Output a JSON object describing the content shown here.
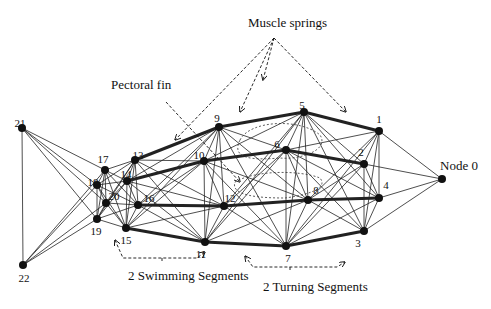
{
  "diagram": {
    "colors": {
      "ink": "#111111",
      "thin_edge": "#222222",
      "background": "#ffffff"
    },
    "nodes": [
      {
        "id": "0",
        "label": "Node 0",
        "x": 442,
        "y": 179,
        "lx": 440,
        "ly": 170,
        "anchor": "start",
        "ldx": -2
      },
      {
        "id": "1",
        "label": "1",
        "x": 379,
        "y": 131,
        "lx": 379,
        "ly": 123,
        "anchor": "middle"
      },
      {
        "id": "2",
        "label": "2",
        "x": 364,
        "y": 164,
        "lx": 361,
        "ly": 156,
        "anchor": "middle"
      },
      {
        "id": "3",
        "label": "3",
        "x": 364,
        "y": 231,
        "lx": 358,
        "ly": 247,
        "anchor": "middle"
      },
      {
        "id": "4",
        "label": "4",
        "x": 379,
        "y": 198,
        "lx": 386,
        "ly": 189,
        "anchor": "middle"
      },
      {
        "id": "5",
        "label": "5",
        "x": 304,
        "y": 112,
        "lx": 302,
        "ly": 109,
        "anchor": "middle"
      },
      {
        "id": "6",
        "label": "6",
        "x": 286,
        "y": 150,
        "lx": 277,
        "ly": 148,
        "anchor": "middle"
      },
      {
        "id": "7",
        "label": "7",
        "x": 286,
        "y": 246,
        "lx": 288,
        "ly": 262,
        "anchor": "middle"
      },
      {
        "id": "8",
        "label": "8",
        "x": 308,
        "y": 200,
        "lx": 316,
        "ly": 194,
        "anchor": "middle"
      },
      {
        "id": "9",
        "label": "9",
        "x": 219,
        "y": 127,
        "lx": 217,
        "ly": 122,
        "anchor": "middle"
      },
      {
        "id": "10",
        "label": "10",
        "x": 204,
        "y": 161,
        "lx": 199,
        "ly": 159,
        "anchor": "middle"
      },
      {
        "id": "11",
        "label": "11",
        "x": 205,
        "y": 242,
        "lx": 201,
        "ly": 258,
        "anchor": "middle"
      },
      {
        "id": "12",
        "label": "12",
        "x": 224,
        "y": 206,
        "lx": 230,
        "ly": 202,
        "anchor": "middle"
      },
      {
        "id": "13",
        "label": "13",
        "x": 135,
        "y": 160,
        "lx": 138,
        "ly": 159,
        "anchor": "middle"
      },
      {
        "id": "14",
        "label": "14",
        "x": 127,
        "y": 181,
        "lx": 126,
        "ly": 178,
        "anchor": "middle"
      },
      {
        "id": "15",
        "label": "15",
        "x": 126,
        "y": 228,
        "lx": 126,
        "ly": 244,
        "anchor": "middle"
      },
      {
        "id": "16",
        "label": "16",
        "x": 138,
        "y": 205,
        "lx": 149,
        "ly": 202,
        "anchor": "middle"
      },
      {
        "id": "17",
        "label": "17",
        "x": 105,
        "y": 170,
        "lx": 103,
        "ly": 163,
        "anchor": "middle"
      },
      {
        "id": "18",
        "label": "18",
        "x": 97,
        "y": 185,
        "lx": 93,
        "ly": 186,
        "anchor": "middle"
      },
      {
        "id": "19",
        "label": "19",
        "x": 97,
        "y": 219,
        "lx": 96,
        "ly": 235,
        "anchor": "middle"
      },
      {
        "id": "20",
        "label": "20",
        "x": 106,
        "y": 203,
        "lx": 114,
        "ly": 200,
        "anchor": "middle"
      },
      {
        "id": "21",
        "label": "21",
        "x": 22,
        "y": 128,
        "lx": 20,
        "ly": 127,
        "anchor": "middle"
      },
      {
        "id": "22",
        "label": "22",
        "x": 23,
        "y": 265,
        "lx": 24,
        "ly": 282,
        "anchor": "middle"
      }
    ],
    "thick_edges": [
      [
        "13",
        "9"
      ],
      [
        "9",
        "5"
      ],
      [
        "5",
        "1"
      ],
      [
        "14",
        "10"
      ],
      [
        "10",
        "6"
      ],
      [
        "6",
        "2"
      ],
      [
        "16",
        "12"
      ],
      [
        "12",
        "8"
      ],
      [
        "8",
        "4"
      ],
      [
        "15",
        "11"
      ],
      [
        "11",
        "7"
      ],
      [
        "7",
        "3"
      ]
    ],
    "segments": [
      [
        "17",
        "18",
        "19",
        "20"
      ],
      [
        "13",
        "14",
        "15",
        "16"
      ],
      [
        "9",
        "10",
        "11",
        "12"
      ],
      [
        "5",
        "6",
        "7",
        "8"
      ],
      [
        "1",
        "2",
        "3",
        "4"
      ]
    ],
    "head_node": "0",
    "tail_nodes": [
      "21",
      "22"
    ],
    "annotations": {
      "muscle_springs": {
        "text": "Muscle springs",
        "x": 248,
        "y": 27
      },
      "pectoral_fin": {
        "text": "Pectoral fin",
        "x": 111,
        "y": 89
      },
      "swimming_segments": {
        "text": "2 Swimming Segments",
        "x": 128,
        "y": 280
      },
      "turning_segments": {
        "text": "2 Turning Segments",
        "x": 263,
        "y": 291
      }
    },
    "muscle_arrows": [
      {
        "from": [
          274,
          38
        ],
        "to": [
          175,
          140
        ]
      },
      {
        "from": [
          274,
          38
        ],
        "to": [
          240,
          112
        ]
      },
      {
        "from": [
          274,
          38
        ],
        "to": [
          263,
          80
        ]
      },
      {
        "from": [
          274,
          38
        ],
        "to": [
          346,
          112
        ]
      }
    ],
    "pectoral_line": {
      "from": [
        166,
        102
      ],
      "to": [
        240,
        182
      ]
    },
    "fin_loops": [
      "M 240 140 C 250 120, 300 118, 320 135 C 330 150, 300 160, 280 158 C 255 160, 230 160, 240 140",
      "M 235 182 C 255 170, 300 170, 320 178 C 330 190, 300 196, 285 198 C 260 198, 230 196, 235 182"
    ],
    "segment_brackets": [
      {
        "start": [
          115,
          240
        ],
        "mid": [
          163,
          262
        ],
        "end": [
          205,
          252
        ],
        "kink": [
          162,
          258
        ]
      },
      {
        "start": [
          245,
          256
        ],
        "mid": [
          292,
          271
        ],
        "end": [
          345,
          262
        ],
        "kink": [
          290,
          266
        ]
      }
    ]
  }
}
